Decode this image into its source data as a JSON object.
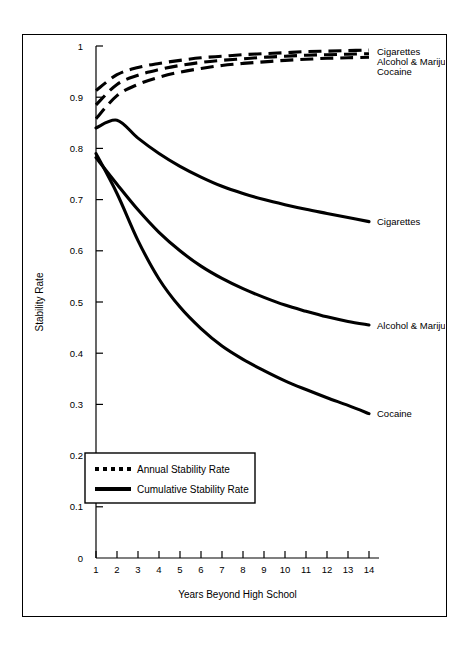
{
  "chart_data": {
    "type": "line",
    "title": "",
    "xlabel": "Years Beyond High School",
    "ylabel": "Stability Rate",
    "xlim": [
      0,
      14.6
    ],
    "ylim": [
      0,
      1
    ],
    "grid": false,
    "x_ticks": [
      "1",
      "2",
      "3",
      "4",
      "5",
      "6",
      "7",
      "8",
      "9",
      "10",
      "11",
      "12",
      "13",
      "14"
    ],
    "x_tick_values": [
      1,
      2,
      3,
      4,
      5,
      6,
      7,
      8,
      9,
      10,
      11,
      12,
      13,
      14
    ],
    "y_ticks": [
      "0",
      "0.1",
      "0.2",
      "0.3",
      "0.4",
      "0.5",
      "0.6",
      "0.7",
      "0.8",
      "0.9",
      "1"
    ],
    "y_tick_values": [
      0,
      0.1,
      0.2,
      0.3,
      0.4,
      0.5,
      0.6,
      0.7,
      0.8,
      0.9,
      1
    ],
    "legend_position": "lower-left-inside",
    "legend": [
      {
        "label": "Annual Stability Rate",
        "style": "dashed"
      },
      {
        "label": "Cumulative Stability Rate",
        "style": "solid"
      }
    ],
    "x": [
      1,
      2,
      3,
      4,
      5,
      6,
      7,
      8,
      9,
      10,
      11,
      12,
      13,
      14
    ],
    "series": [
      {
        "name": "Cigarettes",
        "style": "dashed",
        "group": "Annual Stability Rate",
        "end_label": "Cigarettes",
        "values": [
          0.913,
          0.944,
          0.958,
          0.966,
          0.972,
          0.977,
          0.98,
          0.983,
          0.985,
          0.987,
          0.989,
          0.99,
          0.991,
          0.992
        ]
      },
      {
        "name": "Alcohol & Marijuana",
        "style": "dashed",
        "group": "Annual Stability Rate",
        "end_label": "Alcohol & Marijuana",
        "values": [
          0.885,
          0.925,
          0.943,
          0.954,
          0.962,
          0.968,
          0.972,
          0.975,
          0.978,
          0.98,
          0.982,
          0.983,
          0.984,
          0.985
        ]
      },
      {
        "name": "Cocaine",
        "style": "dashed",
        "group": "Annual Stability Rate",
        "end_label": "Cocaine",
        "values": [
          0.858,
          0.903,
          0.925,
          0.939,
          0.949,
          0.956,
          0.962,
          0.966,
          0.969,
          0.972,
          0.974,
          0.976,
          0.977,
          0.978
        ]
      },
      {
        "name": "Cigarettes",
        "style": "solid",
        "group": "Cumulative Stability Rate",
        "end_label": "Cigarettes",
        "values": [
          0.84,
          0.855,
          0.82,
          0.79,
          0.765,
          0.744,
          0.726,
          0.712,
          0.7,
          0.69,
          0.681,
          0.673,
          0.665,
          0.657
        ]
      },
      {
        "name": "Alcohol & Marijuana",
        "style": "solid",
        "group": "Cumulative Stability Rate",
        "end_label": "Alcohol & Marijuana",
        "values": [
          0.782,
          0.73,
          0.68,
          0.636,
          0.6,
          0.57,
          0.546,
          0.526,
          0.509,
          0.494,
          0.482,
          0.471,
          0.462,
          0.455
        ]
      },
      {
        "name": "Cocaine",
        "style": "solid",
        "group": "Cumulative Stability Rate",
        "end_label": "Cocaine",
        "values": [
          0.79,
          0.712,
          0.62,
          0.545,
          0.49,
          0.448,
          0.414,
          0.388,
          0.366,
          0.346,
          0.329,
          0.313,
          0.298,
          0.282
        ]
      }
    ],
    "annotations": {
      "top_labels": [
        "Cigarettes",
        "Alcohol & Marijuana",
        "Cocaine"
      ],
      "right_labels": [
        "Cigarettes",
        "Alcohol & Marijuana",
        "Cocaine"
      ]
    },
    "colors": {
      "line": "#000000",
      "background": "#ffffff",
      "frame": "#000000"
    }
  }
}
